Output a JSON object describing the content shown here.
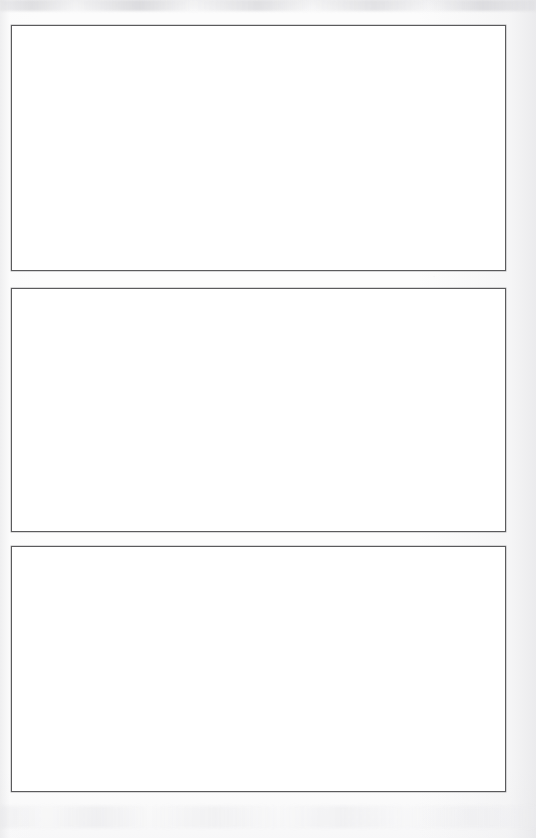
{
  "document": {
    "type": "scanned-page",
    "title": "",
    "page_width": 536,
    "page_height": 838,
    "background_color": "#fcfcfc",
    "paper_color": "#ffffff",
    "line_color": "#5a5a5c",
    "visible_text": "",
    "note": "Blank scanned page: three empty rectangular frames, no text content."
  },
  "frames": [
    {
      "id": "frame-1",
      "label": "",
      "content": "",
      "x": 11,
      "y": 25,
      "width": 495,
      "height": 246,
      "border_color": "#5a5a5c",
      "fill_color": "#ffffff"
    },
    {
      "id": "frame-2",
      "label": "",
      "content": "",
      "x": 11,
      "y": 288,
      "width": 495,
      "height": 244,
      "border_color": "#5a5a5c",
      "fill_color": "#ffffff"
    },
    {
      "id": "frame-3",
      "label": "",
      "content": "",
      "x": 11,
      "y": 546,
      "width": 495,
      "height": 246,
      "border_color": "#5a5a5c",
      "fill_color": "#ffffff"
    }
  ],
  "artifacts": {
    "top_smudge": "scan-shadow-band",
    "bottom_smudge": "scan-shadow-band",
    "speckle_noise": "scanner-speckle"
  }
}
